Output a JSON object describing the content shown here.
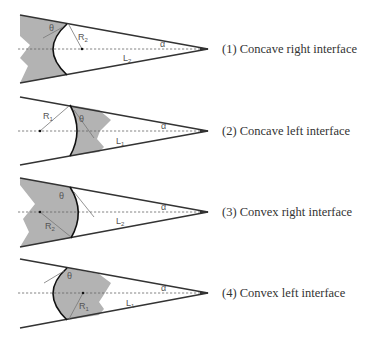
{
  "figure": {
    "colors": {
      "wall": "#333333",
      "fluid": "#b3b3b3",
      "axis": "#666666",
      "meniscus": "#111111",
      "construction_line": "#777777",
      "label": "#555555",
      "caption": "#333333"
    },
    "panels": [
      {
        "id": 1,
        "caption": "(1) Concave right interface",
        "curvature": "concave",
        "fluid_side": "left",
        "radius_label": "R",
        "radius_sub": "2",
        "length_label": "L",
        "length_sub": "2",
        "contact_angle_label": "θ",
        "half_angle_label": "α"
      },
      {
        "id": 2,
        "caption": "(2) Concave left interface",
        "curvature": "concave",
        "fluid_side": "right",
        "radius_label": "R",
        "radius_sub": "1",
        "length_label": "L",
        "length_sub": "1",
        "contact_angle_label": "θ",
        "half_angle_label": "α"
      },
      {
        "id": 3,
        "caption": "(3) Convex right interface",
        "curvature": "convex",
        "fluid_side": "left",
        "radius_label": "R",
        "radius_sub": "2",
        "length_label": "L",
        "length_sub": "2",
        "contact_angle_label": "θ",
        "half_angle_label": "α"
      },
      {
        "id": 4,
        "caption": "(4) Convex left interface",
        "curvature": "convex",
        "fluid_side": "right",
        "radius_label": "R",
        "radius_sub": "1",
        "length_label": "L",
        "length_sub": "1",
        "contact_angle_label": "θ",
        "half_angle_label": "α"
      }
    ]
  }
}
